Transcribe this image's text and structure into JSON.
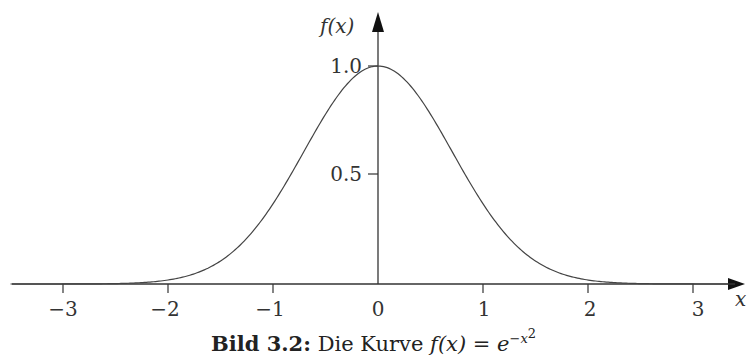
{
  "chart_data": {
    "type": "line",
    "title": "",
    "caption_label": "Bild 3.2:",
    "caption_text": "Die Kurve",
    "caption_formula": "f(x) = e^{-x^2}",
    "function": "f(x) = e^(-x^2)",
    "xlabel": "x",
    "ylabel": "f(x)",
    "xlim": [
      -3.5,
      3.4
    ],
    "ylim": [
      0,
      1.1
    ],
    "x_ticks": [
      "−3",
      "−2",
      "−1",
      "0",
      "1",
      "2",
      "3"
    ],
    "y_ticks": [
      "0.5",
      "1.0"
    ],
    "grid": false,
    "series": [
      {
        "name": "e^(-x^2)",
        "x": [
          -3,
          -2.5,
          -2,
          -1.5,
          -1,
          -0.5,
          0,
          0.5,
          1,
          1.5,
          2,
          2.5,
          3
        ],
        "y": [
          0.0001,
          0.0019,
          0.0183,
          0.1054,
          0.3679,
          0.7788,
          1.0,
          0.7788,
          0.3679,
          0.1054,
          0.0183,
          0.0019,
          0.0001
        ]
      }
    ]
  },
  "labels": {
    "x_axis": "x",
    "y_axis": "f(x)",
    "y_tick_1": "1.0",
    "y_tick_05": "0.5",
    "x_ticks": [
      "−3",
      "−2",
      "−1",
      "0",
      "1",
      "2",
      "3"
    ],
    "caption_bold": "Bild 3.2:",
    "caption_text": "Die Kurve",
    "caption_fx": "f(x) = e",
    "caption_exp": "−x",
    "caption_exp2": "2"
  }
}
